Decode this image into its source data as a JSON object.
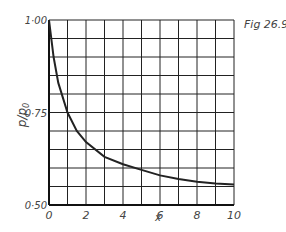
{
  "figure_label": "Fig 26.9",
  "chart_data": {
    "type": "line",
    "title": "",
    "xlabel": "x",
    "ylabel": "p/p0",
    "xlim": [
      0,
      10
    ],
    "ylim": [
      0.5,
      1.0
    ],
    "x_ticks": [
      "0",
      "2",
      "4",
      "6",
      "8",
      "10"
    ],
    "y_ticks": [
      "0·50",
      "0·75",
      "1·00"
    ],
    "grid": true,
    "series": [
      {
        "name": "p/p0",
        "x": [
          0,
          0.25,
          0.5,
          1,
          1.5,
          2,
          3,
          4,
          5,
          6,
          7,
          8,
          9,
          10
        ],
        "values": [
          1.0,
          0.9,
          0.83,
          0.75,
          0.7,
          0.67,
          0.63,
          0.61,
          0.595,
          0.58,
          0.57,
          0.563,
          0.558,
          0.555
        ]
      }
    ]
  }
}
